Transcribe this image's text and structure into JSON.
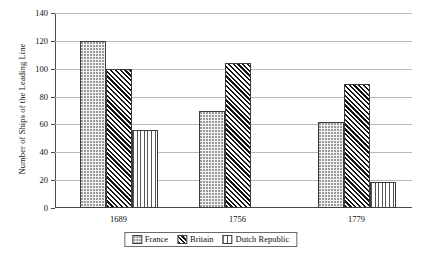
{
  "chart_data": {
    "type": "bar",
    "title": "",
    "subtitle": "",
    "xlabel": "",
    "ylabel": "Number of Ships of the Leading Line",
    "categories": [
      "1689",
      "1756",
      "1779"
    ],
    "series": [
      {
        "name": "France",
        "values": [
          120,
          70,
          62
        ],
        "pattern": "dotted"
      },
      {
        "name": "Britain",
        "values": [
          100,
          104,
          89
        ],
        "pattern": "diagonal-hatch"
      },
      {
        "name": "Dutch Republic",
        "values": [
          56,
          0,
          19
        ],
        "pattern": "vertical-lines"
      }
    ],
    "ylim": [
      0,
      140
    ],
    "ytick_labels": [
      "0",
      "20",
      "40",
      "60",
      "80",
      "100",
      "120",
      "140"
    ],
    "ytick_values": [
      0,
      20,
      40,
      60,
      80,
      100,
      120,
      140
    ],
    "grid": true,
    "legend_position": "bottom-center"
  },
  "colors": {
    "axis": "#4a4a4a",
    "gridline": "#b9b9b9",
    "bar_outline": "#3c3c3c",
    "france_fill": "#f2f2f2",
    "britain_fill": "#141414",
    "dutch_fill": "#555555",
    "text": "#111111",
    "background": "#ffffff"
  }
}
